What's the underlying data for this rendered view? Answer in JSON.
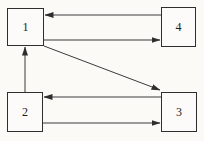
{
  "diagram": {
    "type": "directed-graph",
    "canvas": {
      "width": 204,
      "height": 141
    },
    "colors": {
      "background": "#fbfaf7",
      "edge_line": "#3a3a3a",
      "arrowhead": "#2e2e2e",
      "box_border": "#2e2e2e",
      "box_fill": "#fcfbf9",
      "label_text": "#1c1c1c"
    },
    "nodes": [
      {
        "id": "1",
        "label": "1",
        "x": 7,
        "y": 8,
        "w": 37,
        "h": 38
      },
      {
        "id": "4",
        "label": "4",
        "x": 161,
        "y": 7,
        "w": 35,
        "h": 40
      },
      {
        "id": "2",
        "label": "2",
        "x": 7,
        "y": 92,
        "w": 36,
        "h": 40
      },
      {
        "id": "3",
        "label": "3",
        "x": 161,
        "y": 92,
        "w": 36,
        "h": 40
      }
    ],
    "edges": [
      {
        "from": "4",
        "to": "1",
        "x1": 161,
        "y1": 15,
        "x2": 45,
        "y2": 15
      },
      {
        "from": "1",
        "to": "4",
        "x1": 44,
        "y1": 40,
        "x2": 160,
        "y2": 40
      },
      {
        "from": "1",
        "to": "3",
        "x1": 44,
        "y1": 46,
        "x2": 160,
        "y2": 90
      },
      {
        "from": "2",
        "to": "1",
        "x1": 25,
        "y1": 92,
        "x2": 25,
        "y2": 47
      },
      {
        "from": "3",
        "to": "2",
        "x1": 161,
        "y1": 97,
        "x2": 44,
        "y2": 97
      },
      {
        "from": "2",
        "to": "3",
        "x1": 43,
        "y1": 123,
        "x2": 160,
        "y2": 123
      }
    ]
  }
}
